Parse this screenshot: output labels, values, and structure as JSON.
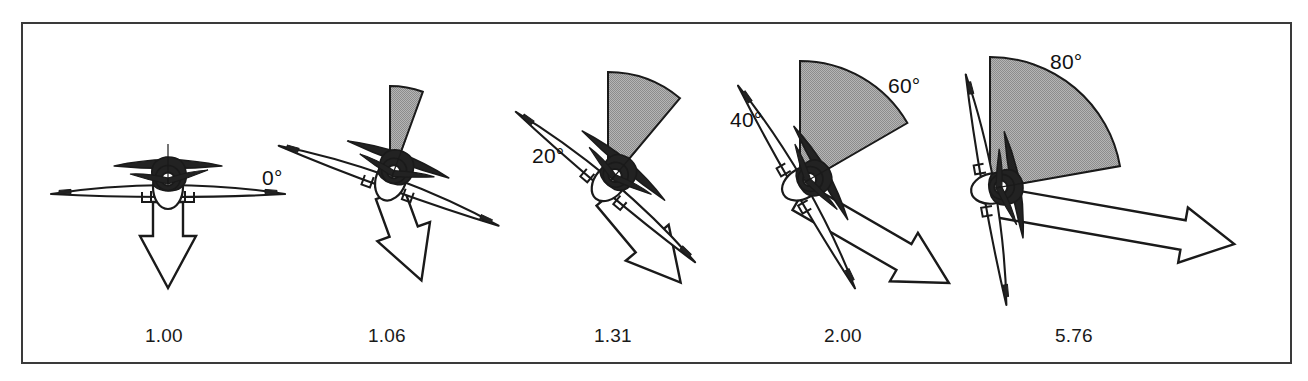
{
  "figure": {
    "type": "technical-diagram",
    "frame_color": "#3a3a3a",
    "sector_fill": "#a9a9a9",
    "sector_stroke": "#1a1a1a",
    "arrow_fill": "#ffffff",
    "arrow_stroke": "#1a1a1a",
    "aircraft_fill": "#222222",
    "background": "#ffffff"
  },
  "panels": [
    {
      "id": "panel-0",
      "angle_label": "0°",
      "angle_deg": 0,
      "load_factor_label": "1.00",
      "load_factor": 1.0,
      "plane_center": [
        168,
        190
      ],
      "angle_label_pos": [
        262,
        166
      ],
      "number_pos": [
        145,
        325
      ],
      "arrow_len": 86,
      "arrow_dir_deg": 90,
      "sector_radius": 0,
      "wing_half_span": 117
    },
    {
      "id": "panel-20",
      "angle_label": "20°",
      "angle_deg": 20,
      "load_factor_label": "1.06",
      "load_factor": 1.06,
      "plane_center": [
        390,
        182
      ],
      "angle_label_pos": [
        532,
        144
      ],
      "number_pos": [
        368,
        325
      ],
      "arrow_len": 92,
      "arrow_dir_deg": 70,
      "sector_radius": 96,
      "wing_half_span": 117
    },
    {
      "id": "panel-40",
      "angle_label": "40°",
      "angle_deg": 40,
      "load_factor_label": "1.31",
      "load_factor": 1.31,
      "plane_center": [
        608,
        184
      ],
      "angle_label_pos": [
        730,
        108
      ],
      "number_pos": [
        594,
        325
      ],
      "arrow_len": 113,
      "arrow_dir_deg": 50,
      "sector_radius": 112,
      "wing_half_span": 117
    },
    {
      "id": "panel-60",
      "angle_label": "60°",
      "angle_deg": 60,
      "load_factor_label": "2.00",
      "load_factor": 2.0,
      "plane_center": [
        800,
        185
      ],
      "angle_label_pos": [
        888,
        74
      ],
      "number_pos": [
        824,
        325
      ],
      "arrow_len": 172,
      "arrow_dir_deg": 30,
      "sector_radius": 124,
      "wing_half_span": 117
    },
    {
      "id": "panel-80",
      "angle_label": "80°",
      "angle_deg": 80,
      "load_factor_label": "5.76",
      "load_factor": 5.76,
      "plane_center": [
        990,
        189
      ],
      "angle_label_pos": [
        1050,
        50
      ],
      "number_pos": [
        1055,
        325
      ],
      "arrow_len": 248,
      "arrow_dir_deg": 10,
      "sector_radius": 132,
      "wing_half_span": 117
    }
  ]
}
